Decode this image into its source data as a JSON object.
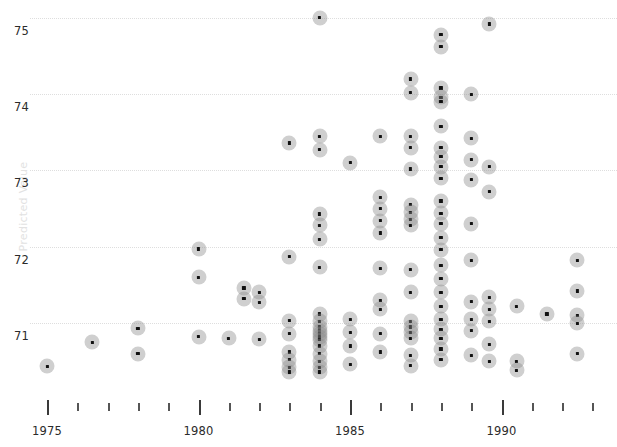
{
  "axes": {
    "y": {
      "label": "Predicted Value",
      "ticks": [
        71,
        72,
        73,
        74,
        75
      ],
      "tick_labels": [
        "71",
        "72",
        "73",
        "74",
        "75"
      ],
      "range": [
        70.3,
        75.35
      ],
      "grid": true,
      "grid_color": "#dedede"
    },
    "x": {
      "label": "",
      "major_ticks": [
        1975,
        1980,
        1985,
        1990
      ],
      "major_tick_labels": [
        "1975",
        "1980",
        "1985",
        "1990"
      ],
      "minor_ticks": [
        1976,
        1977,
        1978,
        1979,
        1981,
        1982,
        1983,
        1984,
        1986,
        1987,
        1988,
        1989,
        1991,
        1992,
        1993
      ],
      "range": [
        1973.7,
        1993.3
      ]
    }
  },
  "style": {
    "marker_fill": "#8c8c8c",
    "marker_core": "#111111",
    "background": "#ffffff",
    "tick_color": "#3a3a3a",
    "text_color": "#2b2b2b"
  },
  "chart_data": {
    "type": "scatter",
    "title": "",
    "subtitle": "",
    "xlabel": "",
    "ylabel": "Predicted Value",
    "xlim": [
      1973.7,
      1993.3
    ],
    "ylim": [
      70.3,
      75.35
    ],
    "grid": true,
    "legend": null,
    "series": [
      {
        "name": "observations",
        "points": [
          [
            1975.0,
            70.43
          ],
          [
            1976.5,
            70.75
          ],
          [
            1978.0,
            70.93
          ],
          [
            1978.0,
            70.6
          ],
          [
            1980.0,
            71.97
          ],
          [
            1980.0,
            71.6
          ],
          [
            1980.0,
            70.82
          ],
          [
            1981.0,
            70.8
          ],
          [
            1981.5,
            71.46
          ],
          [
            1981.5,
            71.32
          ],
          [
            1982.0,
            71.4
          ],
          [
            1982.0,
            71.27
          ],
          [
            1982.0,
            70.79
          ],
          [
            1983.0,
            73.36
          ],
          [
            1983.0,
            71.87
          ],
          [
            1983.0,
            71.03
          ],
          [
            1983.0,
            70.86
          ],
          [
            1983.0,
            70.62
          ],
          [
            1983.0,
            70.52
          ],
          [
            1983.0,
            70.42
          ],
          [
            1983.0,
            70.36
          ],
          [
            1984.0,
            75.0
          ],
          [
            1984.0,
            73.45
          ],
          [
            1984.0,
            73.27
          ],
          [
            1984.0,
            72.43
          ],
          [
            1984.0,
            72.28
          ],
          [
            1984.0,
            72.1
          ],
          [
            1984.0,
            71.73
          ],
          [
            1984.0,
            71.12
          ],
          [
            1984.0,
            71.02
          ],
          [
            1984.0,
            70.95
          ],
          [
            1984.0,
            70.9
          ],
          [
            1984.0,
            70.86
          ],
          [
            1984.0,
            70.82
          ],
          [
            1984.0,
            70.78
          ],
          [
            1984.0,
            70.7
          ],
          [
            1984.0,
            70.6
          ],
          [
            1984.0,
            70.5
          ],
          [
            1984.0,
            70.42
          ],
          [
            1984.0,
            70.36
          ],
          [
            1985.0,
            73.1
          ],
          [
            1985.0,
            71.05
          ],
          [
            1985.0,
            70.88
          ],
          [
            1985.0,
            70.7
          ],
          [
            1985.0,
            70.46
          ],
          [
            1986.0,
            73.45
          ],
          [
            1986.0,
            72.65
          ],
          [
            1986.0,
            72.5
          ],
          [
            1986.0,
            72.34
          ],
          [
            1986.0,
            72.18
          ],
          [
            1986.0,
            71.72
          ],
          [
            1986.0,
            71.3
          ],
          [
            1986.0,
            71.18
          ],
          [
            1986.0,
            70.86
          ],
          [
            1986.0,
            70.62
          ],
          [
            1987.0,
            74.2
          ],
          [
            1987.0,
            74.02
          ],
          [
            1987.0,
            73.45
          ],
          [
            1987.0,
            73.3
          ],
          [
            1987.0,
            73.02
          ],
          [
            1987.0,
            72.55
          ],
          [
            1987.0,
            72.45
          ],
          [
            1987.0,
            72.36
          ],
          [
            1987.0,
            72.28
          ],
          [
            1987.0,
            71.7
          ],
          [
            1987.0,
            71.4
          ],
          [
            1987.0,
            71.02
          ],
          [
            1987.0,
            70.95
          ],
          [
            1987.0,
            70.88
          ],
          [
            1987.0,
            70.8
          ],
          [
            1987.0,
            70.58
          ],
          [
            1987.0,
            70.44
          ],
          [
            1988.0,
            74.78
          ],
          [
            1988.0,
            74.62
          ],
          [
            1988.0,
            74.08
          ],
          [
            1988.0,
            73.96
          ],
          [
            1988.0,
            73.9
          ],
          [
            1988.0,
            73.58
          ],
          [
            1988.0,
            73.3
          ],
          [
            1988.0,
            73.18
          ],
          [
            1988.0,
            73.05
          ],
          [
            1988.0,
            72.9
          ],
          [
            1988.0,
            72.6
          ],
          [
            1988.0,
            72.44
          ],
          [
            1988.0,
            72.3
          ],
          [
            1988.0,
            72.12
          ],
          [
            1988.0,
            71.96
          ],
          [
            1988.0,
            71.76
          ],
          [
            1988.0,
            71.58
          ],
          [
            1988.0,
            71.4
          ],
          [
            1988.0,
            71.22
          ],
          [
            1988.0,
            71.05
          ],
          [
            1988.0,
            70.92
          ],
          [
            1988.0,
            70.8
          ],
          [
            1988.0,
            70.66
          ],
          [
            1988.0,
            70.52
          ],
          [
            1989.0,
            74.0
          ],
          [
            1989.0,
            73.42
          ],
          [
            1989.0,
            73.14
          ],
          [
            1989.0,
            72.88
          ],
          [
            1989.0,
            72.3
          ],
          [
            1989.0,
            71.82
          ],
          [
            1989.0,
            71.28
          ],
          [
            1989.0,
            71.05
          ],
          [
            1989.0,
            70.9
          ],
          [
            1989.0,
            70.58
          ],
          [
            1989.6,
            74.92
          ],
          [
            1989.6,
            73.05
          ],
          [
            1989.6,
            72.72
          ],
          [
            1989.6,
            71.34
          ],
          [
            1989.6,
            71.18
          ],
          [
            1989.6,
            71.02
          ],
          [
            1989.6,
            70.72
          ],
          [
            1989.6,
            70.5
          ],
          [
            1990.5,
            71.22
          ],
          [
            1990.5,
            70.5
          ],
          [
            1990.5,
            70.38
          ],
          [
            1991.5,
            71.12
          ],
          [
            1992.5,
            71.82
          ],
          [
            1992.5,
            71.42
          ],
          [
            1992.5,
            71.1
          ],
          [
            1992.5,
            71.0
          ],
          [
            1992.5,
            70.6
          ]
        ]
      }
    ]
  }
}
